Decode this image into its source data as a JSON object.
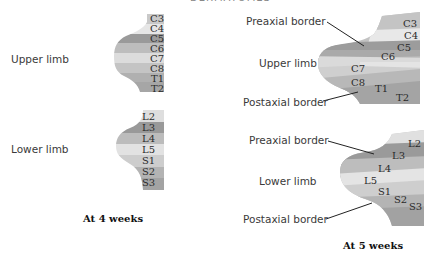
{
  "header": {
    "clipped_title": "DERMATOMES"
  },
  "panel_4wk": {
    "caption": "At 4 weeks",
    "upper": {
      "label": "Upper limb",
      "segments": [
        "C3",
        "C4",
        "C5",
        "C6",
        "C7",
        "C8",
        "T1",
        "T2"
      ],
      "colors": [
        "#c9c9c9",
        "#e6e6e6",
        "#9a9a9a",
        "#bdbdbd",
        "#dcdcdc",
        "#c4c4c4",
        "#b0b0b0",
        "#a6a6a6"
      ]
    },
    "lower": {
      "label": "Lower limb",
      "segments": [
        "L2",
        "L3",
        "L4",
        "L5",
        "S1",
        "S2",
        "S3"
      ],
      "colors": [
        "#dedede",
        "#999999",
        "#bcbcbc",
        "#e2e2e2",
        "#cdcdcd",
        "#b3b3b3",
        "#a3a3a3"
      ]
    }
  },
  "panel_5wk": {
    "caption": "At 5 weeks",
    "upper": {
      "label": "Upper limb",
      "preaxial_label": "Preaxial border",
      "postaxial_label": "Postaxial border",
      "segments": [
        "C3",
        "C4",
        "C5",
        "C6",
        "C7",
        "C8",
        "T1",
        "T2"
      ]
    },
    "lower": {
      "label": "Lower limb",
      "preaxial_label": "Preaxial border",
      "postaxial_label": "Postaxial border",
      "segments": [
        "L2",
        "L3",
        "L4",
        "L5",
        "S1",
        "S2",
        "S3"
      ]
    }
  }
}
